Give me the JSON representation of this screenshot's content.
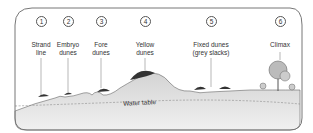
{
  "diagram": {
    "stages": [
      {
        "number": "1",
        "label": "Strand\nline"
      },
      {
        "number": "2",
        "label": "Embryo\ndunes"
      },
      {
        "number": "3",
        "label": "Fore\ndunes"
      },
      {
        "number": "4",
        "label": "Yellow\ndunes"
      },
      {
        "number": "5",
        "label": "Fixed dunes\n(grey slacks)"
      },
      {
        "number": "6",
        "label": "Climax"
      }
    ],
    "water_table_label": "Water table",
    "colors": {
      "frame": "#777777",
      "ground": "#d9d9d9",
      "ground_light": "#ebebeb",
      "vegetation": "#333333",
      "leader_line": "#888888"
    }
  }
}
